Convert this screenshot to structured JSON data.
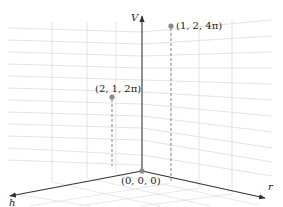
{
  "diagram": {
    "type": "3d-coordinate-system",
    "axes": {
      "vertical": {
        "label": "V"
      },
      "left": {
        "label": "h"
      },
      "right": {
        "label": "r"
      }
    },
    "origin": {
      "label": "(0, 0, 0)"
    },
    "points": [
      {
        "label": "(1, 2, 4π)",
        "coords": [
          1,
          2,
          "4π"
        ]
      },
      {
        "label": "(2, 1, 2π)",
        "coords": [
          2,
          1,
          "2π"
        ]
      }
    ],
    "colors": {
      "axis": "#333333",
      "grid": "#d9d9d9",
      "point": "#888888",
      "dashed": "#777777"
    }
  }
}
